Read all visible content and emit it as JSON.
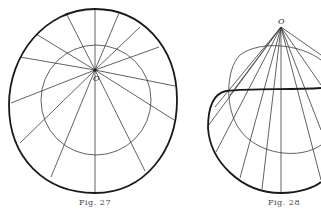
{
  "figures": [
    {
      "caption": "Fig. 27",
      "point_label": "O",
      "description": "Closed oval with a point O inside; rays from O to the boundary and a circle around O"
    },
    {
      "caption": "Fig. 28",
      "point_label": "O",
      "description": "Cone with apex O over the curve; generator lines from apex to the boundary curve"
    }
  ],
  "colors": {
    "ink": "#1a1a1a",
    "thin_ink": "#3a3a3a",
    "background": "#ffffff"
  }
}
